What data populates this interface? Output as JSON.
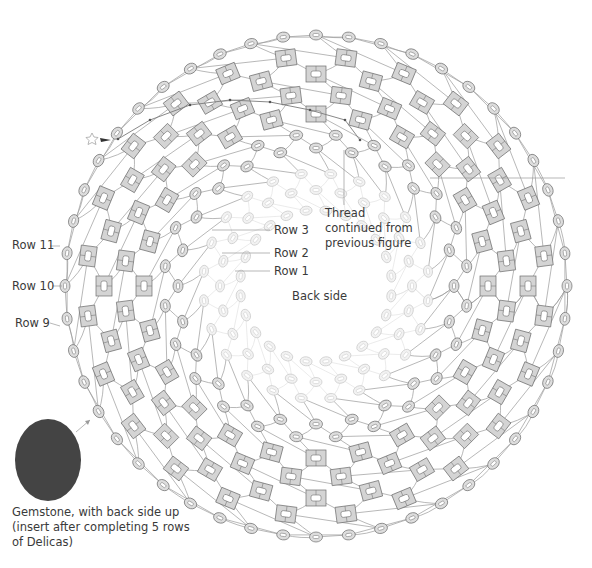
{
  "figure": {
    "center": {
      "x": 316,
      "y": 286
    },
    "colors": {
      "thread": "#9a9a9a",
      "delica_fill": "#d4d4d4",
      "delica_stroke": "#6e6e6e",
      "seed_fill": "#dddddd",
      "seed_stroke": "#707070",
      "faint_fill": "#f2f2f2",
      "faint_stroke": "#c8c8c8",
      "gemstone": "#444444",
      "leader": "#9a9a9a"
    },
    "rings": [
      {
        "name": "row-1",
        "type": "faint",
        "r": 76,
        "count": 24,
        "offset": 0.5
      },
      {
        "name": "row-2",
        "type": "faint",
        "r": 96,
        "count": 24,
        "offset": 0
      },
      {
        "name": "row-3",
        "type": "faint",
        "r": 113,
        "count": 24,
        "offset": 0.5
      },
      {
        "name": "row-4",
        "type": "seed",
        "r": 138,
        "count": 24,
        "offset": 0
      },
      {
        "name": "row-5",
        "type": "seed",
        "r": 152,
        "count": 24,
        "offset": 0.5
      },
      {
        "name": "row-6",
        "type": "delica",
        "r": 172,
        "count": 24,
        "offset": 0
      },
      {
        "name": "row-7",
        "type": "delica",
        "r": 192,
        "count": 24,
        "offset": 0.5
      },
      {
        "name": "row-8",
        "type": "delica",
        "r": 212,
        "count": 24,
        "offset": 0
      },
      {
        "name": "row-9",
        "type": "delica",
        "r": 230,
        "count": 24,
        "offset": 0.5
      },
      {
        "name": "row-10",
        "type": "seed",
        "r": 251,
        "count": 24,
        "offset": 0
      },
      {
        "name": "row-11",
        "type": "seed",
        "r": 251,
        "count": 24,
        "offset": 0.5
      }
    ]
  },
  "labels": {
    "row11": "Row 11",
    "row10": "Row 10",
    "row9": "Row 9",
    "row3": "Row 3",
    "row2": "Row 2",
    "row1": "Row 1",
    "thread": "Thread continued from previous figure",
    "back_side": "Back side",
    "gemstone": "Gemstone, with back side up (insert after completing 5 rows of Delicas)"
  },
  "legend_marks": {
    "start_marker": "star-outline",
    "needle": "needle-arrow"
  }
}
